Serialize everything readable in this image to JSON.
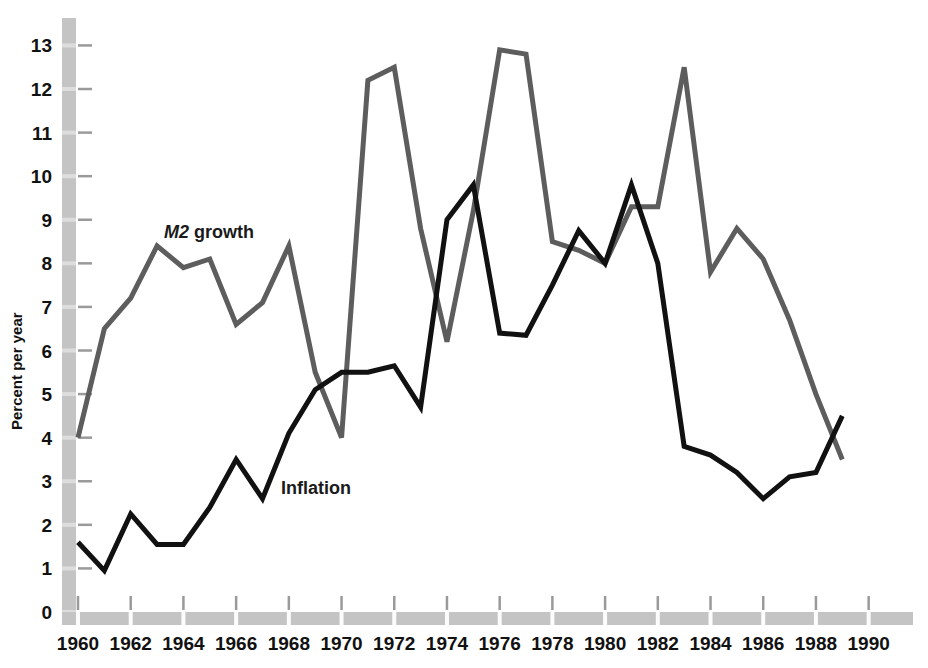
{
  "chart_data": {
    "type": "line",
    "title": "",
    "xlabel": "",
    "ylabel": "Percent per year",
    "xlim": [
      1960,
      1991
    ],
    "ylim": [
      0,
      13.4
    ],
    "grid": false,
    "legend_position": "inline-annotations",
    "x_ticks": [
      1960,
      1962,
      1964,
      1966,
      1968,
      1970,
      1972,
      1974,
      1976,
      1978,
      1980,
      1982,
      1984,
      1986,
      1988,
      1990
    ],
    "x_tick_labels": [
      "1960",
      "1962",
      "1964",
      "1966",
      "1968",
      "1970",
      "1972",
      "1974",
      "1976",
      "1978",
      "1980",
      "1982",
      "1984",
      "1986",
      "1988",
      "1990"
    ],
    "y_ticks": [
      0,
      1,
      2,
      3,
      4,
      5,
      6,
      7,
      8,
      9,
      10,
      11,
      12,
      13
    ],
    "y_tick_labels": [
      "0",
      "1",
      "2",
      "3",
      "4",
      "5",
      "6",
      "7",
      "8",
      "9",
      "10",
      "11",
      "12",
      "13"
    ],
    "x": [
      1960,
      1961,
      1962,
      1963,
      1964,
      1965,
      1966,
      1967,
      1968,
      1969,
      1970,
      1971,
      1972,
      1973,
      1974,
      1975,
      1976,
      1977,
      1978,
      1979,
      1980,
      1981,
      1982,
      1983,
      1984,
      1985,
      1986,
      1987,
      1988,
      1989
    ],
    "series": [
      {
        "name": "M2 growth",
        "label": "M2 growth",
        "label_em": "M2",
        "label_rest": " growth",
        "color": "#5d5d5d",
        "stroke_width": 5,
        "values": [
          4.0,
          6.5,
          7.2,
          8.4,
          7.9,
          8.1,
          6.6,
          7.1,
          8.4,
          5.5,
          4.0,
          12.2,
          12.5,
          8.8,
          6.2,
          9.2,
          12.9,
          12.8,
          8.5,
          8.3,
          8.0,
          9.3,
          9.3,
          12.5,
          7.8,
          8.8,
          8.1,
          6.7,
          5.0,
          3.5
        ]
      },
      {
        "name": "Inflation",
        "label": "Inflation",
        "color": "#111111",
        "stroke_width": 5,
        "values": [
          1.6,
          0.95,
          2.25,
          1.55,
          1.55,
          2.4,
          3.5,
          2.6,
          4.1,
          5.1,
          5.5,
          5.5,
          5.65,
          4.7,
          9.0,
          9.8,
          6.4,
          6.35,
          7.5,
          8.75,
          8.0,
          9.8,
          8.0,
          3.8,
          3.6,
          3.2,
          2.6,
          3.1,
          3.2,
          4.5
        ]
      }
    ],
    "annotations": [
      {
        "name": "m2-growth-label",
        "text": "M2 growth",
        "x_px": 164,
        "y_px": 238
      },
      {
        "name": "inflation-label",
        "text": "Inflation",
        "x_px": 281,
        "y_px": 494
      }
    ],
    "colors": {
      "axis_band": "#c4c4c4",
      "tick_mark": "#9a9a9a",
      "m2": "#5d5d5d",
      "inflation": "#111111",
      "background": "#ffffff",
      "text": "#111111"
    },
    "geometry": {
      "plot_left": 78,
      "plot_right": 895,
      "plot_top": 28,
      "plot_bottom": 612,
      "y_axis_band_x": 62,
      "y_axis_band_width": 14,
      "x_axis_band_y": 612,
      "x_axis_band_height": 13,
      "px_per_year": 26.35,
      "px_per_unit": 44.15
    }
  }
}
